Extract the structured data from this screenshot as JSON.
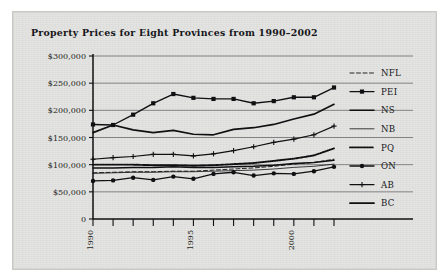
{
  "figure": {
    "title": "Property Prices for Eight Provinces from 1990–2002",
    "background_color": "#e3e3e1",
    "ink_color": "#101013"
  },
  "axes": {
    "y_ticks": [
      "$300,000",
      "$250,000",
      "$200,000",
      "$150,000",
      "$100,000",
      "$50,000",
      "0"
    ],
    "x_ticks_visible": [
      "1990",
      "1995",
      "2000"
    ]
  },
  "legend": {
    "position": "right",
    "items": [
      {
        "label": "NFL",
        "style": "dashed"
      },
      {
        "label": "PEI",
        "style": "line-square-marker"
      },
      {
        "label": "NS",
        "style": "solid-thick"
      },
      {
        "label": "NB",
        "style": "solid-thin"
      },
      {
        "label": "PQ",
        "style": "dotted"
      },
      {
        "label": "ON",
        "style": "line-circle-marker"
      },
      {
        "label": "AB",
        "style": "line-plus-marker"
      },
      {
        "label": "BC",
        "style": "solid-heavy"
      }
    ]
  },
  "chart_data": {
    "type": "line",
    "title": "Property Prices for Eight Provinces from 1990–2002",
    "xlabel": "",
    "ylabel": "",
    "x": [
      1990,
      1991,
      1992,
      1993,
      1994,
      1995,
      1996,
      1997,
      1998,
      1999,
      2000,
      2001,
      2002
    ],
    "xlim": [
      1990,
      2002
    ],
    "ylim": [
      0,
      300000
    ],
    "ytick_values": [
      0,
      50000,
      100000,
      150000,
      200000,
      250000,
      300000
    ],
    "grid": true,
    "legend_position": "right",
    "series": [
      {
        "name": "NFL",
        "style": "dashed",
        "values": [
          85000,
          86000,
          87000,
          87000,
          88000,
          88000,
          90000,
          92000,
          94000,
          97000,
          101000,
          104000,
          110000
        ]
      },
      {
        "name": "PEI",
        "style": "line-square-marker",
        "values": [
          174000,
          173000,
          192000,
          213000,
          230000,
          223000,
          221000,
          221000,
          213000,
          217000,
          224000,
          224000,
          242000
        ]
      },
      {
        "name": "NS",
        "style": "solid-thick",
        "values": [
          94000,
          94000,
          95000,
          95000,
          96000,
          95000,
          95000,
          96000,
          97000,
          99000,
          102000,
          104000,
          108000
        ]
      },
      {
        "name": "NB",
        "style": "solid-thin",
        "values": [
          84000,
          85000,
          86000,
          86000,
          87000,
          87000,
          88000,
          89000,
          90000,
          92000,
          95000,
          97000,
          101000
        ]
      },
      {
        "name": "PQ",
        "style": "dotted",
        "values": [
          100000,
          100000,
          100000,
          99000,
          99000,
          98000,
          99000,
          101000,
          103000,
          107000,
          111000,
          117000,
          130000
        ]
      },
      {
        "name": "ON",
        "style": "line-circle-marker",
        "values": [
          70000,
          71000,
          76000,
          72000,
          78000,
          74000,
          83000,
          86000,
          80000,
          84000,
          83000,
          88000,
          96000
        ]
      },
      {
        "name": "AB",
        "style": "line-plus-marker",
        "values": [
          110000,
          113000,
          115000,
          119000,
          119000,
          116000,
          120000,
          126000,
          133000,
          141000,
          147000,
          155000,
          171000
        ]
      },
      {
        "name": "BC",
        "style": "solid-heavy",
        "values": [
          159000,
          173000,
          164000,
          159000,
          163000,
          156000,
          155000,
          165000,
          168000,
          174000,
          184000,
          193000,
          211000
        ]
      }
    ]
  }
}
